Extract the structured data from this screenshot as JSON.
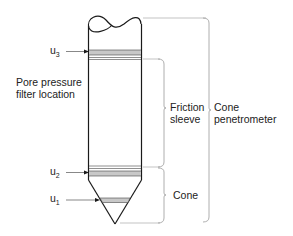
{
  "diagram": {
    "labels": {
      "u3": {
        "main": "u",
        "sub": "3"
      },
      "u2": {
        "main": "u",
        "sub": "2"
      },
      "u1": {
        "main": "u",
        "sub": "1"
      },
      "pore_pressure_line1": "Pore pressure",
      "pore_pressure_line2": "filter location",
      "friction_line1": "Friction",
      "friction_line2": "sleeve",
      "cone_pen_line1": "Cone",
      "cone_pen_line2": "penetrometer",
      "cone": "Cone"
    },
    "colors": {
      "outline": "#1a1a1a",
      "filter_band": "#c8c8c8",
      "bracket": "#9a9a9a",
      "text": "#222222"
    }
  }
}
